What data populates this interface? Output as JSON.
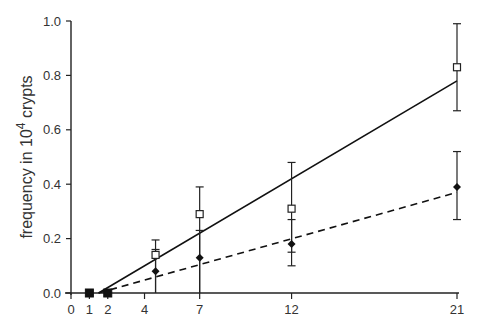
{
  "chart_data": {
    "type": "line",
    "title": "",
    "xlabel": "",
    "ylabel": "frequency in 10^4 crypts",
    "ylabel_parts": {
      "pre": "frequency in 10",
      "sup": "4",
      "post": " crypts"
    },
    "x_ticks": [
      0,
      1,
      2,
      4,
      7,
      12,
      21
    ],
    "y_ticks": [
      0.0,
      0.2,
      0.4,
      0.6,
      0.8,
      1.0
    ],
    "y_tick_labels": [
      "0.0",
      "0.2",
      "0.4",
      "0.6",
      "0.8",
      "1.0"
    ],
    "xlim": [
      0,
      21
    ],
    "ylim": [
      0,
      1.0
    ],
    "grid": false,
    "series": [
      {
        "name": "open squares",
        "marker": "square-open",
        "x": [
          1,
          2,
          4.6,
          7,
          12,
          21
        ],
        "y": [
          0.0,
          0.0,
          0.14,
          0.29,
          0.31,
          0.83
        ],
        "err_upper": [
          0.0,
          0.0,
          0.195,
          0.39,
          0.48,
          0.99
        ],
        "err_lower": [
          0.0,
          0.0,
          0.0,
          0.0,
          0.15,
          0.67
        ],
        "fit_line": {
          "style": "solid",
          "x": [
            1.5,
            21
          ],
          "y": [
            0.0,
            0.78
          ]
        }
      },
      {
        "name": "filled diamonds",
        "marker": "diamond-filled",
        "x": [
          1,
          2,
          4.6,
          7,
          12,
          21
        ],
        "y": [
          0.0,
          0.0,
          0.08,
          0.13,
          0.18,
          0.39
        ],
        "err_upper": [
          0.0,
          0.0,
          0.16,
          0.23,
          0.27,
          0.52
        ],
        "err_lower": [
          0.0,
          0.0,
          0.0,
          0.0,
          0.1,
          0.27
        ],
        "fit_line": {
          "style": "dashed",
          "x": [
            1.5,
            21
          ],
          "y": [
            0.0,
            0.37
          ]
        }
      }
    ]
  }
}
